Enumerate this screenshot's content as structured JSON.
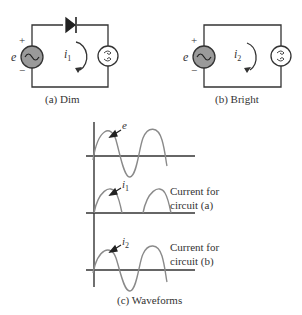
{
  "circuit_a": {
    "caption": "(a) Dim",
    "source_label": "e",
    "plus": "+",
    "minus": "−",
    "current_label": "i",
    "current_sub": "1",
    "components": [
      "ac-voltage-source",
      "diode",
      "lamp"
    ]
  },
  "circuit_b": {
    "caption": "(b) Bright",
    "source_label": "e",
    "plus": "+",
    "minus": "−",
    "current_label": "i",
    "current_sub": "2",
    "components": [
      "ac-voltage-source",
      "lamp"
    ]
  },
  "waveforms": {
    "caption": "(c) Waveforms",
    "traces": [
      {
        "label": "e",
        "sub": "",
        "type": "full-sine",
        "note": ""
      },
      {
        "label": "i",
        "sub": "1",
        "type": "half-wave-rectified",
        "note_line1": "Current for",
        "note_line2": "circuit (a)"
      },
      {
        "label": "i",
        "sub": "2",
        "type": "full-sine",
        "note_line1": "Current for",
        "note_line2": "circuit (b)"
      }
    ]
  },
  "colors": {
    "wire": "#333333",
    "source_fill": "#9a9a9a",
    "wave": "#8a8a8a",
    "text": "#333333"
  }
}
